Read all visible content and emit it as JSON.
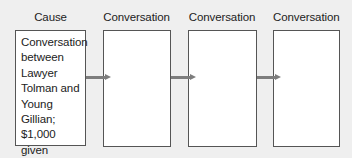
{
  "diagram": {
    "type": "cause-effect flow chart",
    "columns": [
      {
        "label": "Cause",
        "content": "Conversation between Lawyer Tolman and Young Gillian; $1,000 given to Gillian",
        "lines": [
          "Conversation",
          "between",
          "Lawyer",
          "Tolman and",
          "Young Gillian;",
          "$1,000 given",
          "to Gillian"
        ]
      },
      {
        "label": "Conversation",
        "content": ""
      },
      {
        "label": "Conversation",
        "content": ""
      },
      {
        "label": "Conversation",
        "content": ""
      }
    ],
    "arrows": [
      {
        "from": 0,
        "to": 1
      },
      {
        "from": 1,
        "to": 2
      },
      {
        "from": 2,
        "to": 3
      }
    ],
    "colors": {
      "background": "#efefef",
      "box_fill": "#ffffff",
      "box_border": "#555555",
      "arrow": "#7d7d7d"
    }
  }
}
